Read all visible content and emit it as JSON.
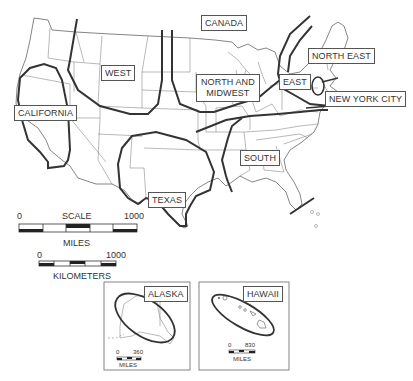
{
  "map": {
    "title": "",
    "regions": [
      {
        "id": "canada",
        "label": "CANADA"
      },
      {
        "id": "west",
        "label": "WEST"
      },
      {
        "id": "north-midwest",
        "label_line1": "NORTH AND",
        "label_line2": "MIDWEST"
      },
      {
        "id": "east",
        "label": "EAST"
      },
      {
        "id": "north-east",
        "label": "NORTH EAST"
      },
      {
        "id": "nyc",
        "label": "NEW YORK CITY"
      },
      {
        "id": "california",
        "label": "CALIFORNIA"
      },
      {
        "id": "south",
        "label": "SOUTH"
      },
      {
        "id": "texas",
        "label": "TEXAS"
      }
    ]
  },
  "scale": {
    "title": "SCALE",
    "miles": {
      "start": "0",
      "end": "1000",
      "unit": "MILES"
    },
    "kilometers": {
      "start": "0",
      "end": "1000",
      "unit": "KILOMETERS"
    }
  },
  "insets": {
    "alaska": {
      "label": "ALASKA",
      "scale_start": "0",
      "scale_end": "360",
      "unit": "MILES"
    },
    "hawaii": {
      "label": "HAWAII",
      "scale_start": "0",
      "scale_end": "830",
      "unit": "MILES"
    }
  },
  "colors": {
    "line": "#333333",
    "state_border": "#777777",
    "background": "#ffffff"
  }
}
